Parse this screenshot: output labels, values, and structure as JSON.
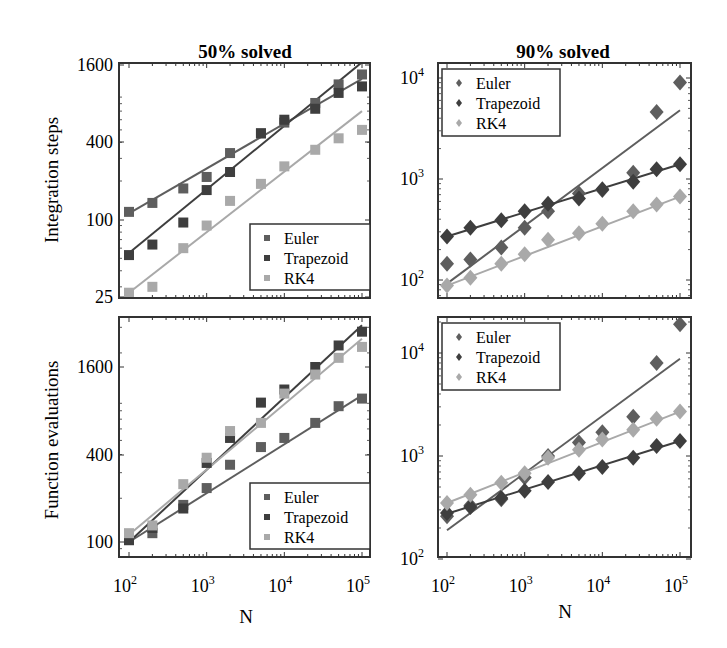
{
  "figure": {
    "column_titles": [
      "50% solved",
      "90% solved"
    ],
    "row_labels": [
      "Integration steps",
      "Function evaluations"
    ],
    "xlabel": "N",
    "colors": {
      "Euler": "#5e5e5e",
      "Trapezoid": "#3e3e3e",
      "RK4": "#a9a9a9",
      "frame": "#333333"
    }
  },
  "chart_data": [
    {
      "type": "scatter",
      "title": "50% solved",
      "xlabel": "",
      "ylabel": "Integration steps",
      "xscale": "log",
      "yscale": "log",
      "xlim": [
        100,
        100000
      ],
      "ylim": [
        25,
        1600
      ],
      "xticks": [
        "10^2",
        "10^3",
        "10^4",
        "10^5"
      ],
      "yticks": [
        "25",
        "100",
        "400",
        "1600"
      ],
      "marker": "square",
      "legend": {
        "position": "lower right",
        "entries": [
          "Euler",
          "Trapezoid",
          "RK4"
        ]
      },
      "x": [
        100,
        200,
        500,
        1000,
        2000,
        5000,
        10000,
        25000,
        50000,
        100000
      ],
      "series": [
        {
          "name": "Euler",
          "values": [
            115,
            135,
            175,
            215,
            330,
            470,
            570,
            810,
            1130,
            1350
          ],
          "fit": [
            112,
            1250
          ]
        },
        {
          "name": "Trapezoid",
          "values": [
            53,
            64,
            95,
            170,
            235,
            470,
            600,
            730,
            970,
            1090
          ],
          "fit": [
            55,
            1680
          ]
        },
        {
          "name": "RK4",
          "values": [
            27,
            30,
            60,
            90,
            140,
            190,
            260,
            350,
            430,
            500
          ],
          "fit": [
            27,
            700
          ]
        }
      ]
    },
    {
      "type": "scatter",
      "title": "90% solved",
      "xlabel": "",
      "ylabel": "",
      "xscale": "log",
      "yscale": "log",
      "xlim": [
        100,
        100000
      ],
      "ylim": [
        80,
        12000
      ],
      "xticks": [
        "10^2",
        "10^3",
        "10^4",
        "10^5"
      ],
      "yticks": [
        "10^2",
        "10^3",
        "10^4"
      ],
      "marker": "diamond",
      "legend": {
        "position": "upper left",
        "entries": [
          "Euler",
          "Trapezoid",
          "RK4"
        ]
      },
      "x": [
        100,
        200,
        500,
        1000,
        2000,
        5000,
        10000,
        25000,
        50000,
        100000
      ],
      "series": [
        {
          "name": "Euler",
          "values": [
            145,
            160,
            210,
            330,
            480,
            720,
            780,
            1150,
            4600,
            9000
          ],
          "fit": [
            92,
            4800
          ]
        },
        {
          "name": "Trapezoid",
          "values": [
            270,
            330,
            390,
            480,
            570,
            640,
            790,
            940,
            1250,
            1400
          ],
          "fit": [
            270,
            1400
          ]
        },
        {
          "name": "RK4",
          "values": [
            88,
            105,
            145,
            180,
            250,
            290,
            360,
            480,
            560,
            670
          ],
          "fit": [
            88,
            670
          ]
        }
      ]
    },
    {
      "type": "scatter",
      "title": "",
      "xlabel": "N",
      "ylabel": "Function evaluations",
      "xscale": "log",
      "yscale": "log",
      "xlim": [
        100,
        100000
      ],
      "ylim": [
        90,
        3600
      ],
      "xticks": [
        "10^2",
        "10^3",
        "10^4",
        "10^5"
      ],
      "yticks": [
        "100",
        "400",
        "1600"
      ],
      "marker": "square",
      "legend": {
        "position": "lower right",
        "entries": [
          "Euler",
          "Trapezoid",
          "RK4"
        ]
      },
      "x": [
        100,
        200,
        500,
        1000,
        2000,
        5000,
        10000,
        25000,
        50000,
        100000
      ],
      "series": [
        {
          "name": "Euler",
          "values": [
            103,
            115,
            180,
            235,
            340,
            450,
            520,
            660,
            860,
            970
          ],
          "fit": [
            100,
            1020
          ]
        },
        {
          "name": "Trapezoid",
          "values": [
            103,
            125,
            170,
            350,
            520,
            910,
            1120,
            1600,
            2250,
            2800
          ],
          "fit": [
            100,
            3100
          ]
        },
        {
          "name": "RK4",
          "values": [
            115,
            130,
            250,
            380,
            580,
            660,
            1050,
            1420,
            1850,
            2200
          ],
          "fit": [
            112,
            2500
          ]
        }
      ]
    },
    {
      "type": "scatter",
      "title": "",
      "xlabel": "N",
      "ylabel": "",
      "xscale": "log",
      "yscale": "log",
      "xlim": [
        100,
        100000
      ],
      "ylim": [
        100,
        25000
      ],
      "xticks": [
        "10^2",
        "10^3",
        "10^4",
        "10^5"
      ],
      "yticks": [
        "10^2",
        "10^3",
        "10^4"
      ],
      "marker": "diamond",
      "legend": {
        "position": "upper left",
        "entries": [
          "Euler",
          "Trapezoid",
          "RK4"
        ]
      },
      "x": [
        100,
        200,
        500,
        1000,
        2000,
        5000,
        10000,
        25000,
        50000,
        100000
      ],
      "series": [
        {
          "name": "Euler",
          "values": [
            260,
            330,
            380,
            620,
            1000,
            1350,
            1700,
            2400,
            8000,
            19000
          ],
          "fit": [
            190,
            8800
          ]
        },
        {
          "name": "Trapezoid",
          "values": [
            280,
            320,
            390,
            460,
            560,
            680,
            780,
            960,
            1250,
            1400
          ],
          "fit": [
            275,
            1400
          ]
        },
        {
          "name": "RK4",
          "values": [
            350,
            420,
            550,
            680,
            960,
            1150,
            1450,
            1800,
            2300,
            2700
          ],
          "fit": [
            350,
            2700
          ]
        }
      ]
    }
  ]
}
